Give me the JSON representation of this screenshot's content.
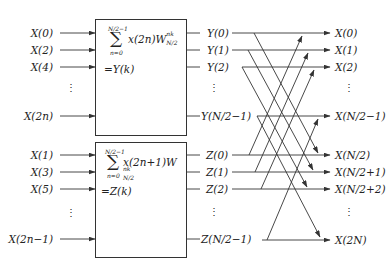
{
  "diagram": {
    "colors": {
      "line": "#333333",
      "text": "#222222",
      "background": "#ffffff"
    }
  },
  "top_block": {
    "inputs": [
      "X(0)",
      "X(2)",
      "X(4)",
      "X(2n)"
    ],
    "sum_upper": "N/2−1",
    "sum_lower": "n=0",
    "sum_symbol": "∑",
    "term": "x(2n)W",
    "twiddle_sup": "nk",
    "twiddle_sub": "N/2",
    "result": "=Y(k)",
    "outputs": [
      "Y(0)",
      "Y(1)",
      "Y(2)",
      "Y(N/2−1)"
    ]
  },
  "bottom_block": {
    "inputs": [
      "X(1)",
      "X(3)",
      "X(5)",
      "X(2n−1)"
    ],
    "sum_upper": "N/2−1",
    "sum_lower": "n=0",
    "sum_symbol": "∑",
    "term": "x(2n+1)W",
    "twiddle_sup": "nk",
    "twiddle_sub": "N/2",
    "result": "=Z(k)",
    "outputs": [
      "Z(0)",
      "Z(1)",
      "Z(2)",
      "Z(N/2−1)"
    ]
  },
  "final_outputs": [
    "X(0)",
    "X(1)",
    "X(2)",
    "X(N/2−1)",
    "X(N/2)",
    "X(N/2+1)",
    "X(N/2+2)",
    "X(2N)"
  ],
  "ellipsis": "⋮"
}
